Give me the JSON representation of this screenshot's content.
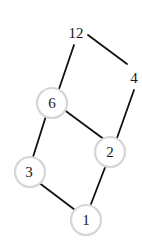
{
  "colors": {
    "edge": "#111111",
    "ring": "#d6d6d6",
    "text": "#1a1a1a",
    "background": "#ffffff"
  },
  "nodes": [
    {
      "id": "n12",
      "label": "12",
      "circled": false
    },
    {
      "id": "n4",
      "label": "4",
      "circled": false
    },
    {
      "id": "n6",
      "label": "6",
      "circled": true
    },
    {
      "id": "n2",
      "label": "2",
      "circled": true
    },
    {
      "id": "n3",
      "label": "3",
      "circled": true
    },
    {
      "id": "n1",
      "label": "1",
      "circled": true
    }
  ],
  "edges": [
    {
      "from": "12",
      "to": "4"
    },
    {
      "from": "12",
      "to": "6"
    },
    {
      "from": "4",
      "to": "2"
    },
    {
      "from": "6",
      "to": "2"
    },
    {
      "from": "6",
      "to": "3"
    },
    {
      "from": "2",
      "to": "1"
    },
    {
      "from": "3",
      "to": "1"
    }
  ]
}
